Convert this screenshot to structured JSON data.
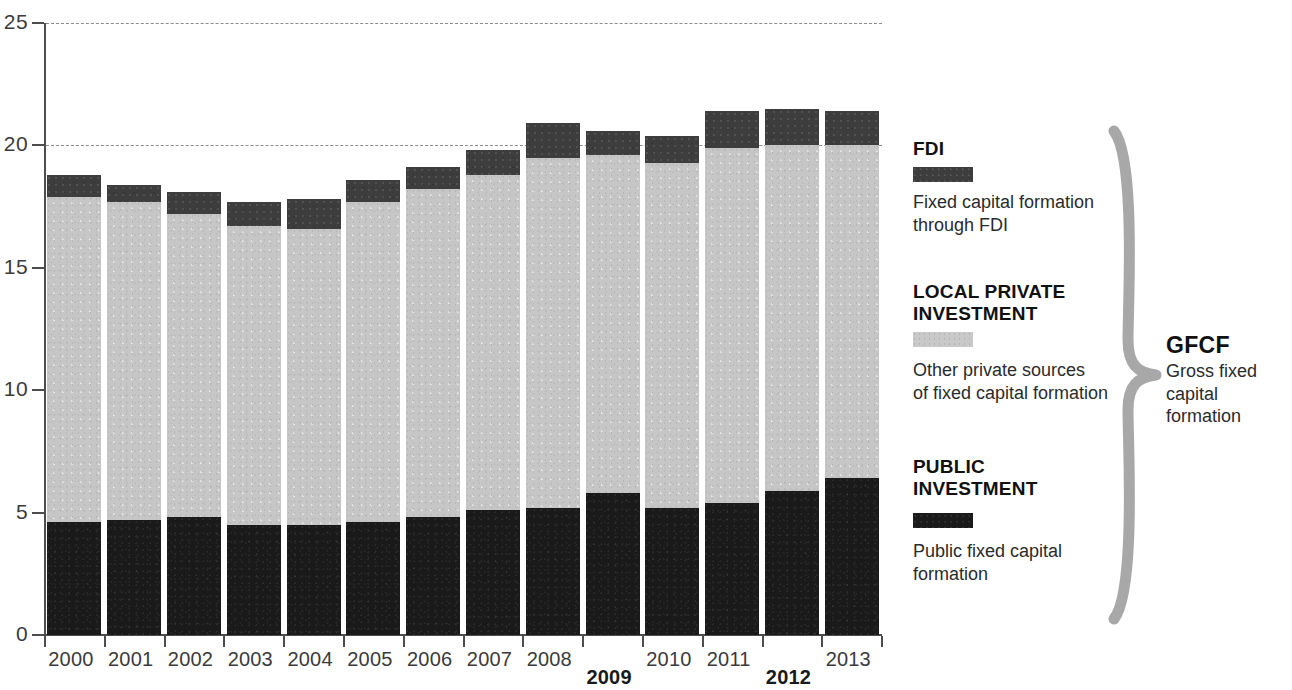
{
  "chart_data": {
    "type": "bar",
    "subtype": "stacked-vertical",
    "title": "",
    "xlabel": "",
    "ylabel": "",
    "ylim": [
      0,
      25
    ],
    "yticks": [
      0,
      5,
      10,
      15,
      20,
      25
    ],
    "ytick_labels": [
      "0",
      "5",
      "10",
      "15",
      "20",
      "25"
    ],
    "gridlines": [
      20,
      25
    ],
    "grid": "dashed horizontal at 20 and 25 only",
    "legend_position": "right",
    "categories": [
      "2000",
      "2001",
      "2002",
      "2003",
      "2004",
      "2005",
      "2006",
      "2007",
      "2008",
      "2009",
      "2010",
      "2011",
      "2012",
      "2013"
    ],
    "emphasized_categories": [
      "2009",
      "2012"
    ],
    "series": [
      {
        "name": "PUBLIC INVESTMENT",
        "color": "#1a1a1a",
        "values": [
          4.6,
          4.7,
          4.8,
          4.5,
          4.5,
          4.6,
          4.8,
          5.1,
          5.2,
          5.8,
          5.2,
          5.4,
          5.9,
          6.4
        ]
      },
      {
        "name": "LOCAL PRIVATE INVESTMENT",
        "color": "#c6c6c6",
        "values": [
          13.3,
          13.0,
          12.4,
          12.2,
          12.1,
          13.1,
          13.4,
          13.7,
          14.3,
          13.8,
          14.1,
          14.5,
          14.1,
          13.6
        ]
      },
      {
        "name": "FDI",
        "color": "#3d3d3d",
        "values": [
          0.9,
          0.7,
          0.9,
          1.0,
          1.2,
          0.9,
          0.9,
          1.0,
          1.4,
          1.0,
          1.1,
          1.5,
          1.5,
          1.4
        ]
      }
    ],
    "totals": [
      18.8,
      18.4,
      18.1,
      17.7,
      17.8,
      18.6,
      19.1,
      19.8,
      20.9,
      20.6,
      20.4,
      21.4,
      21.5,
      21.4
    ]
  },
  "legend": {
    "fdi": {
      "title": "FDI",
      "swatch_name": "fdi-color-swatch",
      "description_line1": "Fixed capital formation",
      "description_line2": "through FDI"
    },
    "local": {
      "title_line1": "LOCAL PRIVATE",
      "title_line2": "INVESTMENT",
      "swatch_name": "local-private-color-swatch",
      "description_line1": "Other private sources",
      "description_line2": "of fixed capital formation"
    },
    "public": {
      "title_line1": "PUBLIC",
      "title_line2": "INVESTMENT",
      "swatch_name": "public-investment-color-swatch",
      "description_line1": "Public fixed capital",
      "description_line2": "formation"
    }
  },
  "grouping": {
    "label": "GFCF",
    "description_line1": "Gross fixed",
    "description_line2": "capital formation",
    "brace_color": "#a8a8a8"
  }
}
